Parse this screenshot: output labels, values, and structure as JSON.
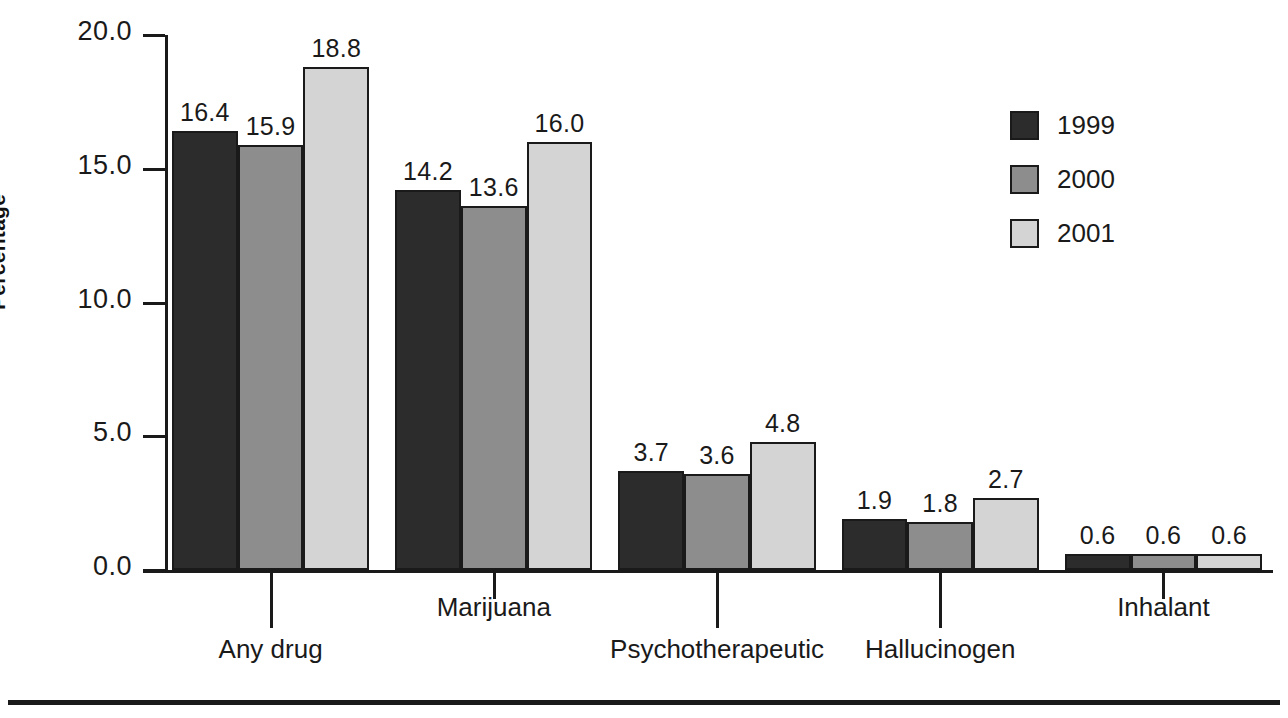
{
  "chart_data": {
    "type": "bar",
    "title": "",
    "subtitle": "",
    "xlabel": "",
    "ylabel": "Percentage",
    "ylim": [
      0.0,
      20.0
    ],
    "yticks": [
      "0.0",
      "5.0",
      "10.0",
      "15.0",
      "20.0"
    ],
    "ytick_values": [
      0.0,
      5.0,
      10.0,
      15.0,
      20.0
    ],
    "grid": false,
    "legend_position": "top-right",
    "categories": [
      "Any drug",
      "Marijuana",
      "Psychotherapeutic",
      "Hallucinogen",
      "Inhalant"
    ],
    "series": [
      {
        "name": "1999",
        "color": "#2c2c2c",
        "values": [
          16.4,
          14.2,
          3.7,
          1.9,
          0.6
        ]
      },
      {
        "name": "2000",
        "color": "#8d8d8d",
        "values": [
          15.9,
          13.6,
          3.6,
          1.8,
          0.6
        ]
      },
      {
        "name": "2001",
        "color": "#d4d4d4",
        "values": [
          18.8,
          16.0,
          4.8,
          2.7,
          0.6
        ]
      }
    ],
    "value_labels": [
      [
        "16.4",
        "15.9",
        "18.8"
      ],
      [
        "14.2",
        "13.6",
        "16.0"
      ],
      [
        "3.7",
        "3.6",
        "4.8"
      ],
      [
        "1.9",
        "1.8",
        "2.7"
      ],
      [
        "0.6",
        "0.6",
        "0.6"
      ]
    ]
  },
  "axis": {
    "y_title": "Percentage",
    "y_tick_labels": [
      "20.0",
      "15.0",
      "10.0",
      "5.0",
      "0.0"
    ]
  },
  "legend": {
    "items": [
      {
        "label": "1999",
        "swatch": "legend-swatch-1999"
      },
      {
        "label": "2000",
        "swatch": "legend-swatch-2000"
      },
      {
        "label": "2001",
        "swatch": "legend-swatch-2001"
      }
    ]
  },
  "categories": [
    {
      "label": "Any drug",
      "row": "lower"
    },
    {
      "label": "Marijuana",
      "row": "upper"
    },
    {
      "label": "Psychotherapeutic",
      "row": "lower"
    },
    {
      "label": "Hallucinogen",
      "row": "lower"
    },
    {
      "label": "Inhalant",
      "row": "upper"
    }
  ]
}
